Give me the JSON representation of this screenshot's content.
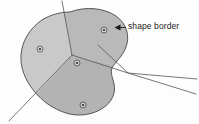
{
  "figure": {
    "background_color": "#fdfdfd",
    "annotation": {
      "label": "shape border",
      "arrow_direction": "left",
      "arrow_target_x": 116,
      "arrow_target_y": 28
    },
    "border": {
      "stroke_color": "#4a4a4a",
      "stroke_width": 0.9
    },
    "regions": [
      {
        "name": "upper-right-region",
        "fill": "#dcdcdc"
      },
      {
        "name": "left-region",
        "fill": "#c9c9c9"
      },
      {
        "name": "center-region",
        "fill": "#b9b9b9"
      },
      {
        "name": "bottom-region",
        "fill": "#b3b3b3"
      }
    ],
    "partition_lines": {
      "stroke_color": "#555555",
      "stroke_width": 0.8,
      "count": 4
    },
    "site_markers": [
      {
        "name": "site-marker-upper-right",
        "x": 104,
        "y": 30
      },
      {
        "name": "site-marker-left",
        "x": 40,
        "y": 49
      },
      {
        "name": "site-marker-center",
        "x": 77,
        "y": 63
      },
      {
        "name": "site-marker-bottom",
        "x": 83,
        "y": 105
      }
    ],
    "marker_style": {
      "outer_radius": 3.0,
      "inner_radius": 1.1,
      "outer_stroke": "#4a4a4a",
      "outer_fill": "#d5d5d5",
      "inner_fill": "#2a2a2a"
    }
  }
}
